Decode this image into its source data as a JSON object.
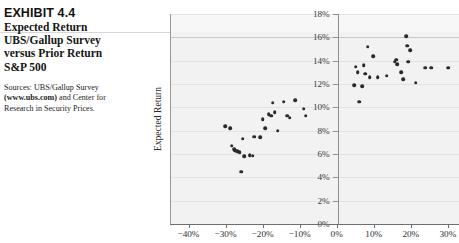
{
  "exhibit": {
    "number": "EXHIBIT 4.4",
    "title_lines": [
      "Expected Return",
      "UBS/Gallup Survey",
      "versus Prior Return",
      "S&P 500"
    ],
    "sources_prefix": "Sources: UBS/Gallup Survey",
    "sources_bold": "(www.ubs.com)",
    "sources_mid": " and Center for",
    "sources_suffix": "Research in Security Prices."
  },
  "chart_data": {
    "type": "scatter",
    "title": "Expected Return UBS/Gallup Survey versus Prior Return S&P 500",
    "xlabel": "",
    "ylabel": "Expected Return",
    "xlim": [
      -45,
      33
    ],
    "ylim": [
      0,
      18
    ],
    "xticks": [
      -40,
      -30,
      -20,
      -10,
      0,
      10,
      20,
      30
    ],
    "xtick_labels": [
      "−40%",
      "−30%",
      "−20%",
      "−10%",
      "0%",
      "10%",
      "20%",
      "30%"
    ],
    "yticks": [
      0,
      2,
      4,
      6,
      8,
      10,
      12,
      14,
      16,
      18
    ],
    "ytick_labels": [
      "0%",
      "2%",
      "4%",
      "6%",
      "8%",
      "10%",
      "12%",
      "14%",
      "16%",
      "18%"
    ],
    "grid": true,
    "legend": false,
    "marker": "filled-circle",
    "marker_color": "#2a2a2a",
    "plot_background": "#f2f2f2",
    "points": [
      [
        -30.4,
        8.4
      ],
      [
        -29.0,
        8.2
      ],
      [
        -28.6,
        6.7
      ],
      [
        -28.0,
        6.4
      ],
      [
        -27.6,
        6.3
      ],
      [
        -27.2,
        6.25
      ],
      [
        -26.9,
        6.2
      ],
      [
        -26.5,
        6.15
      ],
      [
        -26.0,
        4.5
      ],
      [
        -25.6,
        7.3
      ],
      [
        -25.3,
        5.8
      ],
      [
        -23.8,
        5.9
      ],
      [
        -23.0,
        5.85
      ],
      [
        -22.6,
        7.5
      ],
      [
        -21.0,
        7.45
      ],
      [
        -20.2,
        9.0
      ],
      [
        -19.6,
        8.2
      ],
      [
        -18.6,
        9.4
      ],
      [
        -18.0,
        9.3
      ],
      [
        -17.6,
        10.4
      ],
      [
        -17.0,
        9.6
      ],
      [
        -16.2,
        8.0
      ],
      [
        -14.6,
        10.5
      ],
      [
        -13.6,
        9.3
      ],
      [
        -13.0,
        9.1
      ],
      [
        -11.4,
        10.6
      ],
      [
        -9.2,
        9.9
      ],
      [
        -8.6,
        9.3
      ],
      [
        4.4,
        11.9
      ],
      [
        4.8,
        13.5
      ],
      [
        5.4,
        13.0
      ],
      [
        5.8,
        10.5
      ],
      [
        6.6,
        11.8
      ],
      [
        7.0,
        13.6
      ],
      [
        7.4,
        12.9
      ],
      [
        8.1,
        15.2
      ],
      [
        8.6,
        12.6
      ],
      [
        9.6,
        14.4
      ],
      [
        10.8,
        12.6
      ],
      [
        13.2,
        12.7
      ],
      [
        15.4,
        13.9
      ],
      [
        15.8,
        14.1
      ],
      [
        16.1,
        13.7
      ],
      [
        17.2,
        13.0
      ],
      [
        17.6,
        12.4
      ],
      [
        18.4,
        16.1
      ],
      [
        18.8,
        15.3
      ],
      [
        19.0,
        13.9
      ],
      [
        19.6,
        14.9
      ],
      [
        21.0,
        12.1
      ],
      [
        23.6,
        13.4
      ],
      [
        25.2,
        13.4
      ],
      [
        29.8,
        13.4
      ]
    ]
  }
}
